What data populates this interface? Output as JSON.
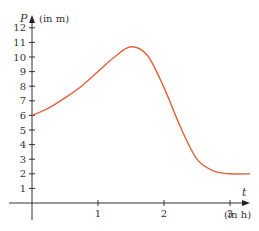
{
  "chart_data": {
    "type": "line",
    "title": "",
    "xlabel": "t",
    "xunit": "(in h)",
    "ylabel": "P",
    "yunit": "(in m)",
    "xlim": [
      0,
      3.5
    ],
    "ylim": [
      0,
      12
    ],
    "x_ticks": [
      "1",
      "2",
      "3"
    ],
    "y_ticks": [
      "1",
      "2",
      "3",
      "4",
      "5",
      "6",
      "7",
      "8",
      "9",
      "10",
      "11",
      "12"
    ],
    "grid": false,
    "series": [
      {
        "name": "P(t)",
        "color": "#e0613a",
        "x": [
          0,
          0.25,
          0.5,
          0.75,
          1.0,
          1.25,
          1.5,
          1.75,
          2.0,
          2.25,
          2.5,
          2.75,
          3.0,
          3.3
        ],
        "y": [
          6.0,
          6.5,
          7.2,
          8.0,
          9.0,
          10.0,
          10.7,
          10.1,
          7.9,
          5.2,
          3.0,
          2.2,
          2.0,
          2.0
        ]
      }
    ]
  }
}
